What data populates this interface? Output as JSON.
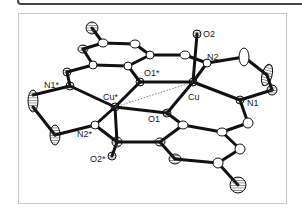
{
  "figure": {
    "type": "ORTEP molecular structure",
    "labels": {
      "cu": "Cu",
      "cu_star": "Cu*",
      "o1": "O1",
      "o1_star": "O1*",
      "o2": "O2",
      "o2_star": "O2*",
      "n1": "N1",
      "n1_star": "N1*",
      "n2": "N2",
      "n2_star": "N2*"
    }
  }
}
